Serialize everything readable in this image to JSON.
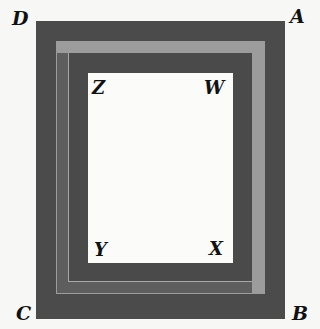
{
  "figure": {
    "outer_rectangle": {
      "vertices": [
        "D",
        "A",
        "B",
        "C"
      ],
      "labels": {
        "top_left": "D",
        "top_right": "A",
        "bottom_right": "B",
        "bottom_left": "C"
      }
    },
    "inner_rectangle": {
      "vertices": [
        "Z",
        "W",
        "X",
        "Y"
      ],
      "labels": {
        "top_left": "Z",
        "top_right": "W",
        "bottom_right": "X",
        "bottom_left": "Y"
      }
    },
    "colors": {
      "background": "#f7f7f5",
      "outer_band": "#4b4b4b",
      "light_band": "#9c9c9c",
      "shadow_band": "#5e5e5e",
      "inner_band": "#4a4a4a",
      "inner_fill": "#fbfbfa",
      "label_color": "#111111"
    }
  }
}
